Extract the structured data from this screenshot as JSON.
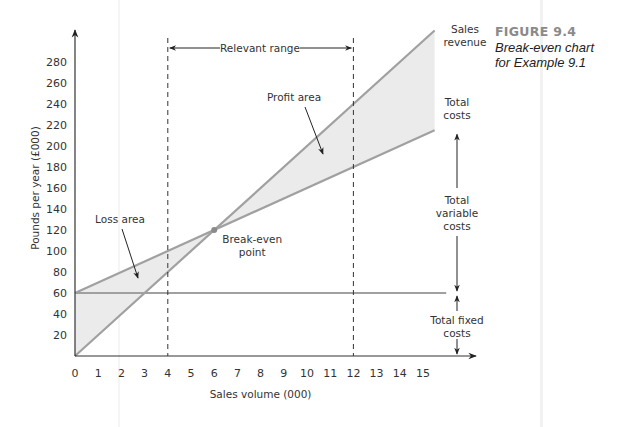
{
  "figure": {
    "number": "FIGURE 9.4",
    "caption_line1": "Break-even chart",
    "caption_line2": "for Example 9.1"
  },
  "chart_data": {
    "type": "line",
    "title": "Break-even chart for Example 9.1",
    "xlabel": "Sales volume (000)",
    "ylabel": "Pounds per year (£000)",
    "x_ticks": [
      0,
      1,
      2,
      3,
      4,
      5,
      6,
      7,
      8,
      9,
      10,
      11,
      12,
      13,
      14,
      15
    ],
    "y_ticks": [
      20,
      40,
      60,
      80,
      100,
      120,
      140,
      160,
      180,
      200,
      220,
      240,
      260,
      280
    ],
    "xlim": [
      0,
      16
    ],
    "ylim": [
      0,
      300
    ],
    "grid": false,
    "series": [
      {
        "name": "Sales revenue",
        "x": [
          0,
          15.5
        ],
        "y": [
          0,
          310
        ],
        "color": "#a8a8a8"
      },
      {
        "name": "Total costs",
        "x": [
          0,
          15.5
        ],
        "y": [
          60,
          215
        ],
        "color": "#a8a8a8"
      },
      {
        "name": "Total fixed costs",
        "x": [
          0,
          16
        ],
        "y": [
          60,
          60
        ],
        "color": "#a8a8a8"
      }
    ],
    "break_even": {
      "x": 6,
      "y": 120,
      "label": "Break-even point"
    },
    "relevant_range": {
      "from": 4,
      "to": 12,
      "label": "Relevant range"
    },
    "areas": [
      {
        "name": "Loss area",
        "from_x": 0,
        "to_x": 6
      },
      {
        "name": "Profit area",
        "from_x": 6,
        "to_x": 15.5
      }
    ],
    "annotations": {
      "sales_revenue": [
        "Sales",
        "revenue"
      ],
      "total_costs": [
        "Total",
        "costs"
      ],
      "total_variable_costs": [
        "Total",
        "variable",
        "costs"
      ],
      "total_fixed_costs": [
        "Total fixed",
        "costs"
      ],
      "loss_area": "Loss area",
      "profit_area": "Profit area",
      "break_even": [
        "Break-even",
        "point"
      ],
      "relevant_range": "Relevant range"
    }
  }
}
